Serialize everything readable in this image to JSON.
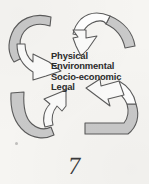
{
  "figure": {
    "type": "cyclical-arrow-diagram",
    "background_color": "#f6f5f2",
    "arrow_band_fill": "#c9c9c9",
    "arrow_outline_color": "#5a5a5a",
    "arrowhead_fill": "#fbfbfa",
    "text_color": "#2b2b2b",
    "center_labels": [
      "Physical",
      "Environmental",
      "Socio-economic",
      "Legal"
    ],
    "arrows": [
      {
        "name": "top-left-arrow",
        "direction": "clockwise-inward",
        "points_to": "down-right"
      },
      {
        "name": "top-right-arrow",
        "direction": "clockwise-inward",
        "points_to": "down-left"
      },
      {
        "name": "bottom-left-arrow",
        "direction": "clockwise-inward",
        "points_to": "up-right"
      },
      {
        "name": "bottom-right-arrow",
        "direction": "clockwise-inward",
        "points_to": "up-left"
      }
    ]
  },
  "page": {
    "number": "7"
  }
}
